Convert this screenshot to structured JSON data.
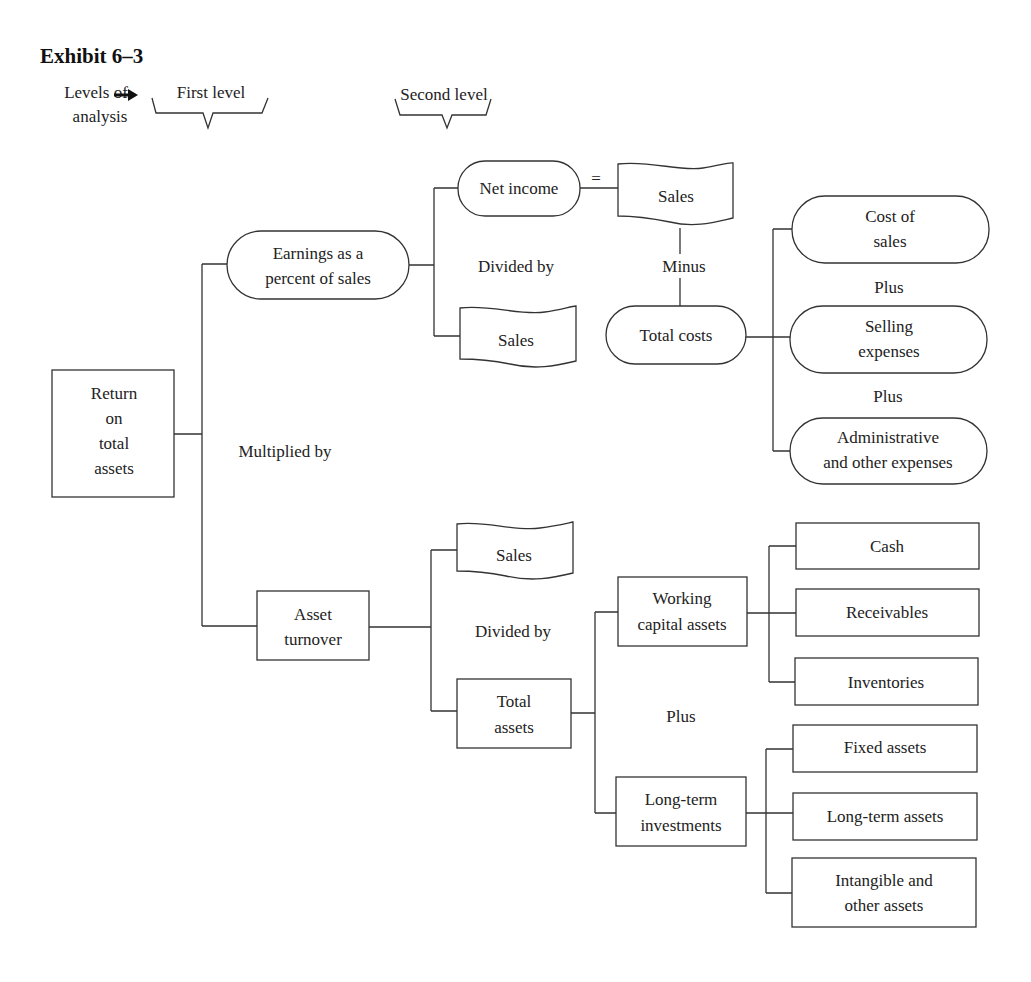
{
  "title": "Exhibit 6–3",
  "levels": {
    "label_line1": "Levels of",
    "label_line2": "analysis",
    "first": "First level",
    "second": "Second level"
  },
  "root": {
    "lines": [
      "Return",
      "on",
      "total",
      "assets"
    ]
  },
  "operators": {
    "multiplied_by": "Multiplied by",
    "divided_by_top": "Divided by",
    "divided_by_bottom": "Divided by",
    "equals": "=",
    "minus": "Minus",
    "plus_1": "Plus",
    "plus_2": "Plus",
    "plus_assets": "Plus"
  },
  "first_level": {
    "earnings": {
      "line1": "Earnings as a",
      "line2": "percent of sales"
    },
    "asset_turnover": {
      "line1": "Asset",
      "line2": "turnover"
    }
  },
  "earnings_branch": {
    "net_income": "Net income",
    "sales_denominator": "Sales",
    "sales": "Sales",
    "total_costs": "Total costs",
    "costs": [
      {
        "line1": "Cost of",
        "line2": "sales"
      },
      {
        "line1": "Selling",
        "line2": "expenses"
      },
      {
        "line1": "Administrative",
        "line2": "and other expenses"
      }
    ]
  },
  "turnover_branch": {
    "sales": "Sales",
    "total_assets": {
      "line1": "Total",
      "line2": "assets"
    },
    "working_capital": {
      "line1": "Working",
      "line2": "capital assets"
    },
    "long_term": {
      "line1": "Long-term",
      "line2": "investments"
    },
    "working_items": [
      "Cash",
      "Receivables",
      "Inventories"
    ],
    "long_term_items": [
      {
        "line1": "Fixed assets",
        "line2": ""
      },
      {
        "line1": "Long-term assets",
        "line2": ""
      },
      {
        "line1": "Intangible and",
        "line2": "other assets"
      }
    ]
  }
}
